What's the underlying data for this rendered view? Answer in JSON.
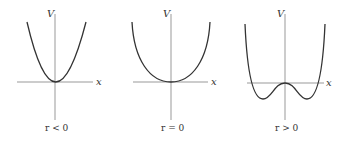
{
  "figure": {
    "panels": [
      {
        "y_label": "V",
        "x_label": "x",
        "caption": "r < 0",
        "shape": "parabola-narrow"
      },
      {
        "y_label": "V",
        "x_label": "x",
        "caption": "r = 0",
        "shape": "quartic-flat"
      },
      {
        "y_label": "V",
        "x_label": "x",
        "caption": "r > 0",
        "shape": "double-well"
      }
    ]
  },
  "colors": {
    "axis": "#999999",
    "curve": "#333333",
    "text": "#333333"
  }
}
